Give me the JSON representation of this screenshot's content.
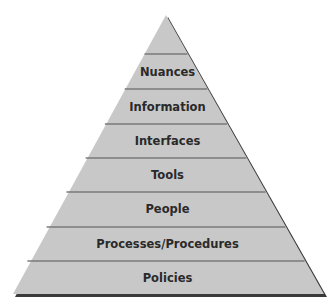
{
  "diagram": {
    "type": "pyramid",
    "layers_top_to_bottom": [
      {
        "label": ""
      },
      {
        "label": "Nuances"
      },
      {
        "label": "Information"
      },
      {
        "label": "Interfaces"
      },
      {
        "label": "Tools"
      },
      {
        "label": "People"
      },
      {
        "label": "Processes/Procedures"
      },
      {
        "label": "Policies"
      }
    ],
    "colors": {
      "fill": "#c8c8c8",
      "divider": "#7a7a7a",
      "shadow": "#3a3a3a"
    }
  }
}
